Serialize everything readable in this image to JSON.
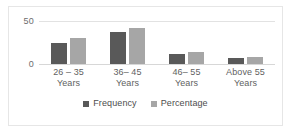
{
  "chart_data": {
    "type": "bar",
    "title": "",
    "xlabel": "",
    "ylabel": "",
    "categories": [
      "26 – 35 Years",
      "36– 45 Years",
      "46– 55 Years",
      "Above 55 Years"
    ],
    "category_lines": [
      {
        "line1": "26 – 35",
        "line2": "Years"
      },
      {
        "line1": "36– 45",
        "line2": "Years"
      },
      {
        "line1": "46– 55",
        "line2": "Years"
      },
      {
        "line1": "Above 55",
        "line2": "Years"
      }
    ],
    "series": [
      {
        "name": "Frequency",
        "color": "#595959",
        "values": [
          24,
          37,
          12,
          7
        ]
      },
      {
        "name": "Percentage",
        "color": "#a6a6a6",
        "values": [
          30,
          42,
          14,
          8
        ]
      }
    ],
    "ylim": [
      0,
      50
    ],
    "yticks": [
      0,
      50
    ],
    "ytick_labels": [
      "0",
      "50"
    ],
    "grid": true,
    "legend_position": "bottom"
  },
  "axis": {
    "y_top_label": "50",
    "y_zero_label": "0"
  },
  "legend": {
    "items": [
      {
        "label": "Frequency",
        "color": "#595959"
      },
      {
        "label": "Percentage",
        "color": "#a6a6a6"
      }
    ]
  },
  "colors": {
    "frequency": "#595959",
    "percentage": "#a6a6a6",
    "gridline": "#e2e2e2",
    "border": "#e6e6e6",
    "text": "#5f5f5f"
  }
}
